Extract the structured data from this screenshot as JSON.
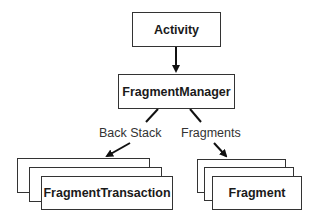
{
  "diagram": {
    "nodes": {
      "activity": "Activity",
      "fragment_manager": "FragmentManager",
      "fragment_transaction": "FragmentTransaction",
      "fragment": "Fragment"
    },
    "edges": {
      "back_stack": "Back Stack",
      "fragments": "Fragments"
    }
  }
}
